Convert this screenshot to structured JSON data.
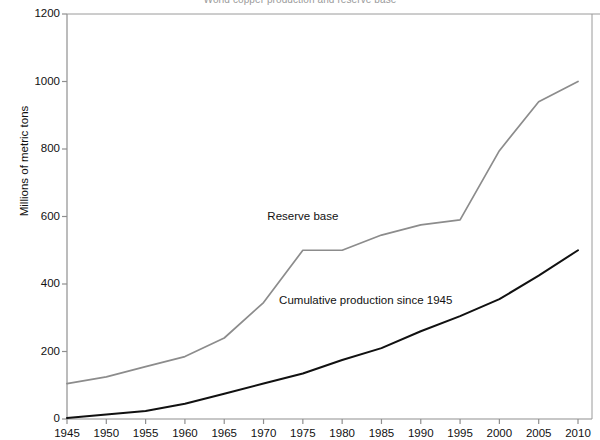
{
  "chart_data": {
    "type": "line",
    "title": "World copper production and reserve base",
    "xlabel": "",
    "ylabel": "Millions of metric tons",
    "xlim": [
      1945,
      2010
    ],
    "ylim": [
      0,
      1200
    ],
    "xticks": [
      1945,
      1950,
      1955,
      1960,
      1965,
      1970,
      1975,
      1980,
      1985,
      1990,
      1995,
      2000,
      2005,
      2010
    ],
    "yticks": [
      0,
      200,
      400,
      600,
      800,
      1000,
      1200
    ],
    "grid": false,
    "legend_position": "inline-annotations",
    "x": [
      1945,
      1950,
      1955,
      1960,
      1965,
      1970,
      1975,
      1980,
      1985,
      1990,
      1995,
      2000,
      2005,
      2010
    ],
    "series": [
      {
        "name": "Reserve base",
        "color": "#8c8c8c",
        "values": [
          105,
          125,
          155,
          185,
          240,
          345,
          500,
          500,
          545,
          575,
          590,
          795,
          940,
          1000
        ]
      },
      {
        "name": "Cumulative production since 1945",
        "color": "#111111",
        "values": [
          3,
          13,
          24,
          45,
          75,
          105,
          135,
          175,
          210,
          260,
          305,
          355,
          425,
          500
        ]
      }
    ],
    "annotations": [
      {
        "text": "Reserve base",
        "x": 1975,
        "y": 600
      },
      {
        "text": "Cumulative production since 1945",
        "x": 1983,
        "y": 350
      }
    ]
  }
}
